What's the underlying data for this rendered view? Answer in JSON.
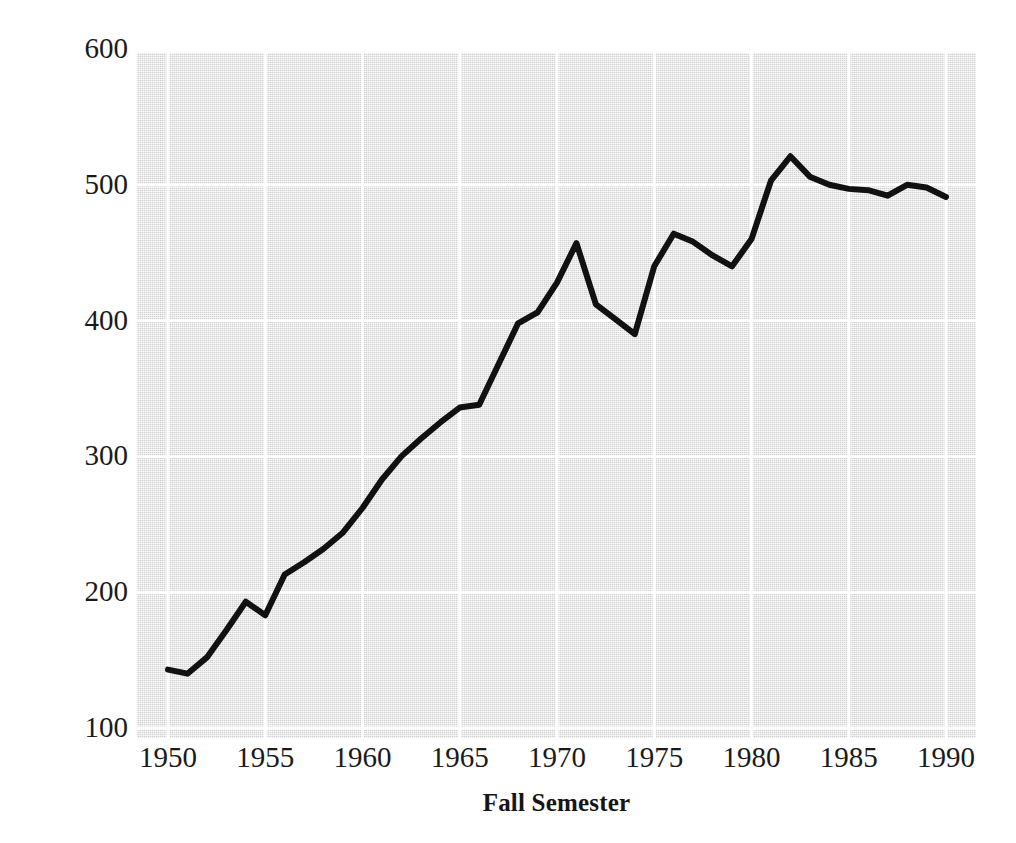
{
  "chart_data": {
    "type": "line",
    "title": "",
    "xlabel": "Fall Semester",
    "ylabel": "Total Graduate Enrollment",
    "xlim": [
      1949,
      1991
    ],
    "ylim": [
      100,
      600
    ],
    "grid": true,
    "legend": null,
    "x_ticks": [
      "1950",
      "1955",
      "1960",
      "1965",
      "1970",
      "1975",
      "1980",
      "1985",
      "1990"
    ],
    "x_tick_values": [
      1950,
      1955,
      1960,
      1965,
      1970,
      1975,
      1980,
      1985,
      1990
    ],
    "y_ticks": [
      "100",
      "200",
      "300",
      "400",
      "500",
      "600"
    ],
    "y_tick_values": [
      100,
      200,
      300,
      400,
      500,
      600
    ],
    "series": [
      {
        "name": "Total Graduate Enrollment",
        "color": "#111111",
        "line_width": 6,
        "x": [
          1950,
          1951,
          1952,
          1953,
          1954,
          1955,
          1956,
          1957,
          1958,
          1959,
          1960,
          1961,
          1962,
          1963,
          1964,
          1965,
          1966,
          1967,
          1968,
          1969,
          1970,
          1971,
          1972,
          1973,
          1974,
          1975,
          1976,
          1977,
          1978,
          1979,
          1980,
          1981,
          1982,
          1983,
          1984,
          1985,
          1986,
          1987,
          1988,
          1989,
          1990
        ],
        "values": [
          143,
          140,
          152,
          172,
          193,
          183,
          213,
          222,
          232,
          244,
          262,
          283,
          300,
          313,
          325,
          336,
          338,
          368,
          398,
          406,
          428,
          457,
          412,
          401,
          390,
          440,
          464,
          458,
          448,
          440,
          460,
          503,
          521,
          506,
          500,
          497,
          496,
          492,
          500,
          498,
          491
        ]
      }
    ],
    "plot_background_color": "#e2e2e2",
    "gridline_color": "#ffffff",
    "page_background_color": "#ffffff"
  }
}
